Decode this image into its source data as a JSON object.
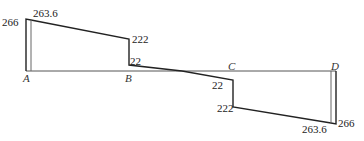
{
  "diagram": {
    "type": "shear-force-diagram",
    "points": [
      {
        "label": "A",
        "x": 26
      },
      {
        "label": "B",
        "x": 129
      },
      {
        "label": "C",
        "x": 233
      },
      {
        "label": "D",
        "x": 336
      }
    ],
    "values": {
      "a_outer": "266",
      "a_inner": "263.6",
      "b_left": "222",
      "b_right": "22",
      "c_left": "22",
      "c_right": "222",
      "d_inner": "263.6",
      "d_outer": "266"
    },
    "colors": {
      "line": "#222222",
      "axis": "#555555"
    }
  }
}
